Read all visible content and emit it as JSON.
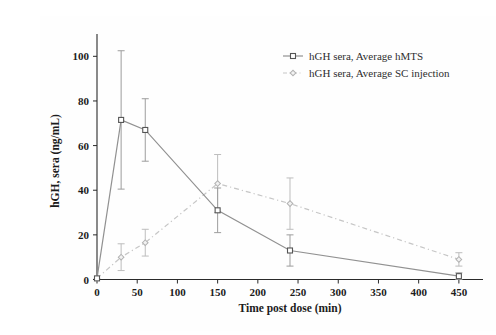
{
  "figure": {
    "background": "#fefefe",
    "width": 456,
    "height": 315
  },
  "chart_data": {
    "type": "line",
    "title": "",
    "xlabel": "Time post dose (min)",
    "ylabel": "hGH, sera (ng/mL)",
    "x": [
      0,
      30,
      60,
      150,
      240,
      450
    ],
    "xlim": [
      0,
      480
    ],
    "ylim": [
      0,
      110
    ],
    "xticks": [
      0,
      50,
      100,
      150,
      200,
      250,
      300,
      350,
      400,
      450
    ],
    "yticks": [
      0,
      20,
      40,
      60,
      80,
      100
    ],
    "grid": false,
    "legend_position": "upper right",
    "series": [
      {
        "name": "hGH sera, Average hMTS",
        "values": [
          0.5,
          71.5,
          67,
          31,
          13,
          1.5
        ],
        "errors": [
          0,
          31,
          14,
          10,
          7,
          1.5
        ],
        "line_style": "solid",
        "marker": "open-square",
        "line_color": "#919191",
        "marker_color": "#555555",
        "marker_fill": "#ffffff",
        "error_color": "#9d9d9d"
      },
      {
        "name": "hGH sera, Average SC injection",
        "values": [
          0.5,
          10,
          16.5,
          43,
          34,
          9
        ],
        "errors": [
          0,
          6,
          6,
          13,
          11.5,
          3
        ],
        "line_style": "dash-dot",
        "marker": "diamond",
        "line_color": "#c6c6c6",
        "marker_color": "#b2b2b2",
        "marker_fill": "#f2f2f2",
        "error_color": "#bdbdbd"
      }
    ],
    "axis_color": "#2a2a2a",
    "tick_label_color": "#1c1c1c"
  }
}
